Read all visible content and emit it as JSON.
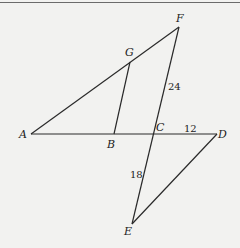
{
  "diagram": {
    "type": "geometry",
    "points": {
      "A": {
        "label": "A",
        "x": 31,
        "y": 134
      },
      "B": {
        "label": "B",
        "x": 114,
        "y": 134
      },
      "C": {
        "label": "C",
        "x": 154,
        "y": 134
      },
      "D": {
        "label": "D",
        "x": 217,
        "y": 134
      },
      "E": {
        "label": "E",
        "x": 132,
        "y": 224
      },
      "F": {
        "label": "F",
        "x": 179,
        "y": 27
      },
      "G": {
        "label": "G",
        "x": 130,
        "y": 62
      }
    },
    "segments": [
      [
        "A",
        "F"
      ],
      [
        "A",
        "D"
      ],
      [
        "F",
        "E"
      ],
      [
        "E",
        "D"
      ],
      [
        "G",
        "B"
      ]
    ],
    "measures": {
      "FC": "24",
      "CD": "12",
      "CE": "18"
    }
  }
}
